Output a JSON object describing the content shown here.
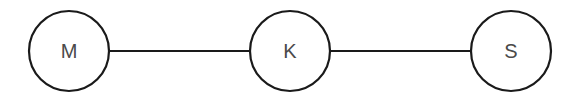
{
  "diagram": {
    "type": "graph",
    "nodes": [
      {
        "id": "M",
        "label": "M",
        "cx": 69,
        "cy": 51,
        "r": 40
      },
      {
        "id": "K",
        "label": "K",
        "cx": 290,
        "cy": 51,
        "r": 40
      },
      {
        "id": "S",
        "label": "S",
        "cx": 511,
        "cy": 51,
        "r": 40
      }
    ],
    "edges": [
      {
        "from": "M",
        "to": "K"
      },
      {
        "from": "K",
        "to": "S"
      }
    ],
    "colors": {
      "stroke": "#1a1a1a",
      "label": "#4a4a4a",
      "background": "#ffffff"
    }
  }
}
